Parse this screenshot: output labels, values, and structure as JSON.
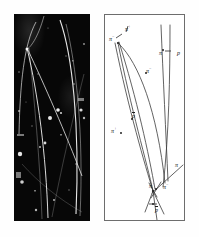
{
  "figure": {
    "panels": [
      {
        "name": "bubble-chamber-photograph",
        "kind": "photo",
        "description": "black bubble chamber photograph with bright curved particle tracks"
      },
      {
        "name": "track-line-diagram",
        "kind": "diagram",
        "description": "line drawing interpretation of the bubble chamber tracks"
      }
    ]
  },
  "diagram": {
    "labels": [
      {
        "id": "pi-minus-top-left",
        "base": "π",
        "charge": "−",
        "overbar": false,
        "x": 4,
        "y": 21
      },
      {
        "id": "pi-plus-top",
        "base": "π",
        "charge": "+",
        "overbar": false,
        "x": 20,
        "y": 11
      },
      {
        "id": "pi-plus-upper-right",
        "base": "π",
        "charge": "+",
        "overbar": false,
        "x": 54,
        "y": 35
      },
      {
        "id": "proton-right",
        "base": "p",
        "charge": "",
        "overbar": false,
        "x": 72,
        "y": 35
      },
      {
        "id": "pi-minus-mid",
        "base": "π",
        "charge": "−",
        "overbar": false,
        "x": 41,
        "y": 53
      },
      {
        "id": "antiproton-mid",
        "base": "p",
        "charge": "",
        "overbar": true,
        "x": 27,
        "y": 98
      },
      {
        "id": "pi-plus-lower-left",
        "base": "π",
        "charge": "+",
        "overbar": false,
        "x": 6,
        "y": 113
      },
      {
        "id": "pi-right-edge",
        "base": "π",
        "charge": "",
        "overbar": false,
        "x": 70,
        "y": 147
      },
      {
        "id": "pi-vertex-left",
        "base": "π",
        "charge": "+",
        "overbar": false,
        "x": 44,
        "y": 168
      },
      {
        "id": "pi-vertex-right",
        "base": "π",
        "charge": "−",
        "overbar": false,
        "x": 58,
        "y": 169
      },
      {
        "id": "antiproton-beam",
        "base": "p",
        "charge": "",
        "overbar": true,
        "x": 50,
        "y": 192
      }
    ]
  },
  "chart_data": {
    "type": "diagram",
    "title": "",
    "tracks": [
      {
        "name": "antiproton-beam",
        "particle": "pbar",
        "path": "M 52,205 L 48,176"
      },
      {
        "name": "pion-plus-outgoing-a",
        "particle": "pi+",
        "path": "M 48,176 C 40,150 24,96 10,28"
      },
      {
        "name": "pion-minus-outgoing-a",
        "particle": "pi-",
        "path": "M 48,176 C 42,148 26,94 13,28"
      },
      {
        "name": "pion-plus-outgoing-b",
        "particle": "pi+",
        "path": "M 50,174 C 44,140 32,84 13,27"
      },
      {
        "name": "pion-minus-long-arc",
        "particle": "pi-",
        "path": "M 14,29 C 34,48 52,96 60,168"
      },
      {
        "name": "proton-track",
        "particle": "p",
        "path": "M 65,14 C 65,60 64,120 58,170"
      },
      {
        "name": "pion-plus-right-arc",
        "particle": "pi+",
        "path": "M 56,14 C 58,60 60,120 62,164"
      },
      {
        "name": "pion-right-edge",
        "particle": "pi",
        "path": "M 47,178 L 78,150"
      },
      {
        "name": "vertex-stub-left",
        "particle": "",
        "path": "M 48,176 L 40,196"
      },
      {
        "name": "vertex-stub-right",
        "particle": "",
        "path": "M 48,176 L 58,198"
      }
    ],
    "vertices": [
      {
        "name": "primary-vertex",
        "x": 48,
        "y": 176
      },
      {
        "name": "secondary-vertex",
        "x": 13,
        "y": 28
      }
    ],
    "xlabel": "",
    "ylabel": "",
    "grid": false,
    "legend": "none"
  }
}
